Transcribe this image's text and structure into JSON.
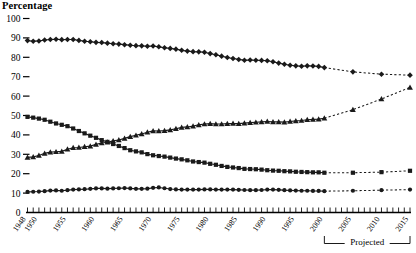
{
  "chart_data": {
    "type": "line",
    "title": "Percentage",
    "xlabel": "",
    "ylabel": "Percentage",
    "ylim": [
      0,
      100
    ],
    "ytick_values": [
      0,
      10,
      20,
      30,
      40,
      50,
      60,
      70,
      80,
      90,
      100
    ],
    "ytick_labels": [
      "0",
      "10",
      "20",
      "30",
      "40",
      "50",
      "60",
      "70",
      "80",
      "90",
      "100"
    ],
    "xlim": [
      1948,
      2015
    ],
    "xtick_labels": [
      "1948",
      "1950",
      "1955",
      "1960",
      "1965",
      "1970",
      "1975",
      "1980",
      "1985",
      "1990",
      "1995",
      "2000",
      "2005",
      "2010",
      "2015"
    ],
    "xtick_years": [
      1948,
      1950,
      1955,
      1960,
      1965,
      1970,
      1975,
      1980,
      1985,
      1990,
      1995,
      2000,
      2005,
      2010,
      2015
    ],
    "minor_tick_interval": 1,
    "grid": false,
    "legend": "none",
    "annotations": [
      {
        "text": "Projected",
        "from_year": 2000,
        "to_year": 2015
      }
    ],
    "projection_start_year": 2000,
    "projection_style": "dashed",
    "series": [
      {
        "name": "series-1",
        "marker": "diamond",
        "x": [
          1948,
          1949,
          1950,
          1951,
          1952,
          1953,
          1954,
          1955,
          1956,
          1957,
          1958,
          1959,
          1960,
          1961,
          1962,
          1963,
          1964,
          1965,
          1966,
          1967,
          1968,
          1969,
          1970,
          1971,
          1972,
          1973,
          1974,
          1975,
          1976,
          1977,
          1978,
          1979,
          1980,
          1981,
          1982,
          1983,
          1984,
          1985,
          1986,
          1987,
          1988,
          1989,
          1990,
          1991,
          1992,
          1993,
          1994,
          1995,
          1996,
          1997,
          1998,
          1999,
          2000,
          2005,
          2010,
          2015
        ],
        "values": [
          88.6,
          88.3,
          88.4,
          88.9,
          89.2,
          89.3,
          89.1,
          89.2,
          89.2,
          88.7,
          88.3,
          88.0,
          87.7,
          87.6,
          87.3,
          87.0,
          86.8,
          86.5,
          86.2,
          86.0,
          85.9,
          85.7,
          85.8,
          85.4,
          84.9,
          84.6,
          84.2,
          83.6,
          83.2,
          82.9,
          82.8,
          82.6,
          81.9,
          81.3,
          80.6,
          79.9,
          79.4,
          78.9,
          78.5,
          78.6,
          78.5,
          78.4,
          78.2,
          77.7,
          77.0,
          76.4,
          75.9,
          75.6,
          75.4,
          75.6,
          75.5,
          75.3,
          74.7,
          72.5,
          71.3,
          70.8
        ]
      },
      {
        "name": "series-2",
        "marker": "triangle",
        "x": [
          1948,
          1949,
          1950,
          1951,
          1952,
          1953,
          1954,
          1955,
          1956,
          1957,
          1958,
          1959,
          1960,
          1961,
          1962,
          1963,
          1964,
          1965,
          1966,
          1967,
          1968,
          1969,
          1970,
          1971,
          1972,
          1973,
          1974,
          1975,
          1976,
          1977,
          1978,
          1979,
          1980,
          1981,
          1982,
          1983,
          1984,
          1985,
          1986,
          1987,
          1988,
          1989,
          1990,
          1991,
          1992,
          1993,
          1994,
          1995,
          1996,
          1997,
          1998,
          1999,
          2000,
          2005,
          2010,
          2015
        ],
        "values": [
          28.4,
          28.7,
          29.4,
          30.5,
          31.1,
          31.3,
          31.5,
          32.6,
          33.4,
          33.5,
          33.9,
          34.2,
          35.1,
          35.8,
          36.2,
          36.9,
          37.4,
          38.2,
          39.1,
          39.8,
          40.5,
          41.4,
          42.1,
          42.0,
          42.2,
          42.6,
          43.2,
          43.9,
          44.1,
          44.5,
          45.2,
          45.6,
          45.8,
          45.6,
          45.6,
          45.8,
          45.9,
          45.8,
          46.1,
          46.3,
          46.5,
          46.7,
          46.9,
          46.7,
          46.7,
          46.6,
          46.9,
          47.2,
          47.4,
          47.8,
          48.0,
          48.1,
          48.6,
          53.0,
          58.5,
          64.5
        ]
      },
      {
        "name": "series-3",
        "marker": "square",
        "x": [
          1948,
          1949,
          1950,
          1951,
          1952,
          1953,
          1954,
          1955,
          1956,
          1957,
          1958,
          1959,
          1960,
          1961,
          1962,
          1963,
          1964,
          1965,
          1966,
          1967,
          1968,
          1969,
          1970,
          1971,
          1972,
          1973,
          1974,
          1975,
          1976,
          1977,
          1978,
          1979,
          1980,
          1981,
          1982,
          1983,
          1984,
          1985,
          1986,
          1987,
          1988,
          1989,
          1990,
          1991,
          1992,
          1993,
          1994,
          1995,
          1996,
          1997,
          1998,
          1999,
          2000,
          2005,
          2010,
          2015
        ],
        "values": [
          49.3,
          48.9,
          48.4,
          47.8,
          46.8,
          45.9,
          45.2,
          44.5,
          43.3,
          42.0,
          40.8,
          39.6,
          38.5,
          37.3,
          36.4,
          35.3,
          34.3,
          33.2,
          32.1,
          31.5,
          31.0,
          30.1,
          29.5,
          29.1,
          28.8,
          28.3,
          27.8,
          27.4,
          26.9,
          26.3,
          26.0,
          25.7,
          25.1,
          24.6,
          24.0,
          23.5,
          23.2,
          22.9,
          22.5,
          22.4,
          22.3,
          22.1,
          21.8,
          21.6,
          21.5,
          21.3,
          21.2,
          21.0,
          20.9,
          20.8,
          20.7,
          20.7,
          20.5,
          20.5,
          20.8,
          21.5
        ]
      },
      {
        "name": "series-4",
        "marker": "circle",
        "x": [
          1948,
          1949,
          1950,
          1951,
          1952,
          1953,
          1954,
          1955,
          1956,
          1957,
          1958,
          1959,
          1960,
          1961,
          1962,
          1963,
          1964,
          1965,
          1966,
          1967,
          1968,
          1969,
          1970,
          1971,
          1972,
          1973,
          1974,
          1975,
          1976,
          1977,
          1978,
          1979,
          1980,
          1981,
          1982,
          1983,
          1984,
          1985,
          1986,
          1987,
          1988,
          1989,
          1990,
          1991,
          1992,
          1993,
          1994,
          1995,
          1996,
          1997,
          1998,
          1999,
          2000,
          2005,
          2010,
          2015
        ],
        "values": [
          10.6,
          10.7,
          10.8,
          11.0,
          11.3,
          11.4,
          11.2,
          11.5,
          11.8,
          11.9,
          12.0,
          12.2,
          12.4,
          12.4,
          12.3,
          12.4,
          12.5,
          12.6,
          12.4,
          12.2,
          12.2,
          12.3,
          12.7,
          12.9,
          12.5,
          12.1,
          11.9,
          11.8,
          11.8,
          11.8,
          11.8,
          11.9,
          11.9,
          11.8,
          11.8,
          11.8,
          11.8,
          11.7,
          11.6,
          11.5,
          11.5,
          11.6,
          11.8,
          11.8,
          11.7,
          11.5,
          11.4,
          11.3,
          11.2,
          11.2,
          11.1,
          11.1,
          11.0,
          11.2,
          11.5,
          11.8
        ]
      }
    ]
  }
}
